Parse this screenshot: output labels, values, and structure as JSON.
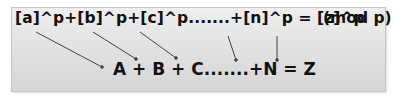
{
  "diagram": {
    "top_equation": "[a]^p+[b]^p+[c]^p.......+[n]^p = [z]^p",
    "modulus": "(mod p)",
    "bottom_equation": "A + B + C.......+N = Z",
    "arrows": [
      {
        "from": "[a]^p",
        "to": "A"
      },
      {
        "from": "[b]^p",
        "to": "B"
      },
      {
        "from": "[c]^p",
        "to": "C"
      },
      {
        "from": "[n]^p",
        "to": "N"
      },
      {
        "from": "[z]^p",
        "to": "Z"
      }
    ],
    "colors": {
      "text": "#111111",
      "arrow": "#444444",
      "panel_top": "#efefef",
      "panel_bottom": "#d6d6d6"
    }
  }
}
